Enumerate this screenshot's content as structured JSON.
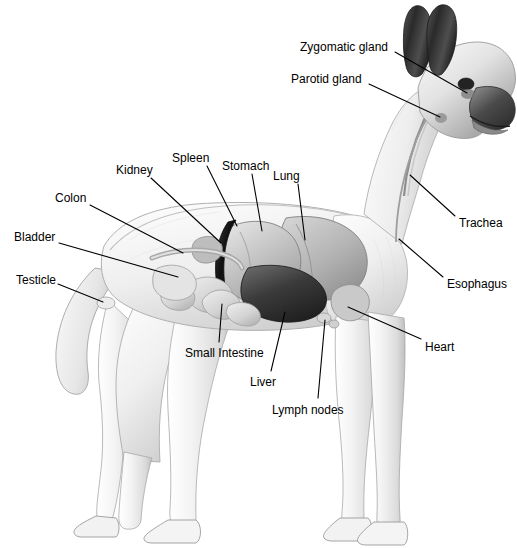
{
  "diagram": {
    "view": "lateral left side",
    "background_color": "#ffffff",
    "line_color": "#000000",
    "text_color": "#000000",
    "width": 517,
    "height": 548,
    "labels": [
      {
        "id": "zygomatic-gland",
        "text": "Zygomatic gland",
        "x": 300,
        "y": 41,
        "anchor": "start",
        "leader": {
          "x1": 395,
          "y1": 52,
          "x2": 467,
          "y2": 93
        }
      },
      {
        "id": "parotid-gland",
        "text": "Parotid gland",
        "x": 291,
        "y": 73,
        "anchor": "start",
        "leader": {
          "x1": 369,
          "y1": 84,
          "x2": 440,
          "y2": 117
        }
      },
      {
        "id": "kidney",
        "text": "Kidney",
        "x": 116,
        "y": 164,
        "anchor": "start",
        "leader": {
          "x1": 151,
          "y1": 178,
          "x2": 221,
          "y2": 243
        }
      },
      {
        "id": "spleen",
        "text": "Spleen",
        "x": 172,
        "y": 152,
        "anchor": "start",
        "leader": {
          "x1": 207,
          "y1": 166,
          "x2": 237,
          "y2": 226
        }
      },
      {
        "id": "stomach",
        "text": "Stomach",
        "x": 222,
        "y": 160,
        "anchor": "start",
        "leader": {
          "x1": 252,
          "y1": 174,
          "x2": 262,
          "y2": 231
        }
      },
      {
        "id": "lung",
        "text": "Lung",
        "x": 273,
        "y": 170,
        "anchor": "start",
        "leader": {
          "x1": 298,
          "y1": 184,
          "x2": 305,
          "y2": 240
        }
      },
      {
        "id": "colon",
        "text": "Colon",
        "x": 55,
        "y": 192,
        "anchor": "start",
        "leader": {
          "x1": 90,
          "y1": 205,
          "x2": 183,
          "y2": 253
        }
      },
      {
        "id": "bladder",
        "text": "Bladder",
        "x": 14,
        "y": 231,
        "anchor": "start",
        "leader": {
          "x1": 59,
          "y1": 243,
          "x2": 178,
          "y2": 277
        }
      },
      {
        "id": "testicle",
        "text": "Testicle",
        "x": 16,
        "y": 274,
        "anchor": "start",
        "leader": {
          "x1": 58,
          "y1": 284,
          "x2": 103,
          "y2": 302
        }
      },
      {
        "id": "trachea",
        "text": "Trachea",
        "x": 459,
        "y": 217,
        "anchor": "start",
        "leader": {
          "x1": 455,
          "y1": 216,
          "x2": 410,
          "y2": 175
        }
      },
      {
        "id": "esophagus",
        "text": "Esophagus",
        "x": 447,
        "y": 278,
        "anchor": "start",
        "leader": {
          "x1": 443,
          "y1": 277,
          "x2": 399,
          "y2": 239
        }
      },
      {
        "id": "heart",
        "text": "Heart",
        "x": 425,
        "y": 341,
        "anchor": "start",
        "leader": {
          "x1": 421,
          "y1": 339,
          "x2": 348,
          "y2": 307
        }
      },
      {
        "id": "small-intestine",
        "text": "Small Intestine",
        "x": 185,
        "y": 347,
        "anchor": "start",
        "leader": {
          "x1": 219,
          "y1": 342,
          "x2": 222,
          "y2": 304
        }
      },
      {
        "id": "liver",
        "text": "Liver",
        "x": 250,
        "y": 376,
        "anchor": "start",
        "leader": {
          "x1": 271,
          "y1": 371,
          "x2": 285,
          "y2": 312
        }
      },
      {
        "id": "lymph-nodes",
        "text": "Lymph nodes",
        "x": 272,
        "y": 404,
        "anchor": "start",
        "leader": {
          "x1": 318,
          "y1": 398,
          "x2": 325,
          "y2": 320
        }
      }
    ]
  }
}
